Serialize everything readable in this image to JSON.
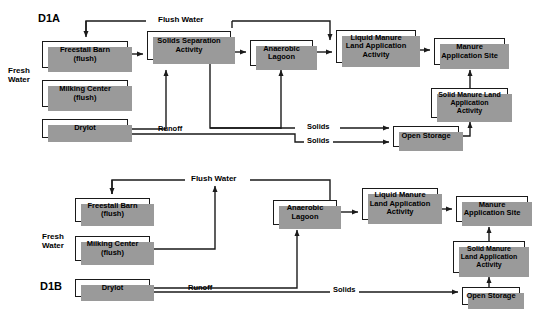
{
  "figure": {
    "background_color": "#ffffff",
    "line_color": "#1a1a1a",
    "shadow_color": "#9a9a9a",
    "box_fill": "#ffffff"
  },
  "diagrams": [
    {
      "id_label": "D1A",
      "id_pos": {
        "x": 38,
        "y": 12,
        "size": 11
      },
      "side_label": {
        "text": "Fresh\nWater",
        "x": 8,
        "y": 66,
        "size": 8
      },
      "nodes": [
        {
          "name": "freestall-barn",
          "label": "Freestall Barn\n(flush)",
          "x": 42,
          "y": 41,
          "w": 86,
          "h": 27,
          "size": 7.5
        },
        {
          "name": "milking-center",
          "label": "Milking Center\n(flush)",
          "x": 42,
          "y": 80,
          "w": 86,
          "h": 27,
          "size": 7.5
        },
        {
          "name": "drylot",
          "label": "Drylot",
          "x": 42,
          "y": 119,
          "w": 86,
          "h": 19,
          "size": 7.5
        },
        {
          "name": "solids-separation-activity",
          "label": "Solids Separation\nActivity",
          "x": 147,
          "y": 31,
          "w": 84,
          "h": 29,
          "size": 7.5
        },
        {
          "name": "anaerobic-lagoon",
          "label": "Anaerobic\nLagoon",
          "x": 250,
          "y": 40,
          "w": 63,
          "h": 26,
          "size": 7.5
        },
        {
          "name": "liquid-manure-land-application-activity",
          "label": "Liquid Manure\nLand Application\nActivity",
          "x": 336,
          "y": 30,
          "w": 80,
          "h": 33,
          "size": 7.5
        },
        {
          "name": "manure-application-site",
          "label": "Manure\nApplication Site",
          "x": 434,
          "y": 38,
          "w": 71,
          "h": 27,
          "size": 7.5
        },
        {
          "name": "solid-manure-land-application-activity",
          "label": "Solid Manure Land\nApplication\nActivity",
          "x": 431,
          "y": 88,
          "w": 77,
          "h": 30,
          "size": 7
        },
        {
          "name": "open-storage",
          "label": "Open Storage",
          "x": 393,
          "y": 126,
          "w": 66,
          "h": 21,
          "size": 7.5
        }
      ],
      "edge_labels": [
        {
          "name": "flush-water-label",
          "text": "Flush Water",
          "x": 155,
          "y": 12,
          "size": 8
        },
        {
          "name": "runoff-label",
          "text": "Runoff",
          "x": 155,
          "y": 126,
          "size": 7.5
        },
        {
          "name": "solids-label-upper",
          "text": "Solids",
          "x": 304,
          "y": 123,
          "size": 7.5
        },
        {
          "name": "solids-label-lower",
          "text": "Solids",
          "x": 304,
          "y": 137,
          "size": 7.5
        }
      ]
    },
    {
      "id_label": "D1B",
      "id_pos": {
        "x": 40,
        "y": 280,
        "size": 11
      },
      "side_label": {
        "text": "Fresh\nWater",
        "x": 42,
        "y": 232,
        "size": 8
      },
      "nodes": [
        {
          "name": "freestall-barn",
          "label": "Freestall Barn\n(flush)",
          "x": 75,
          "y": 198,
          "w": 75,
          "h": 24,
          "size": 7.5
        },
        {
          "name": "milking-center",
          "label": "Milking Center\n(flush)",
          "x": 75,
          "y": 236,
          "w": 75,
          "h": 25,
          "size": 7.5
        },
        {
          "name": "drylot",
          "label": "Drylot",
          "x": 75,
          "y": 279,
          "w": 75,
          "h": 18,
          "size": 7.5
        },
        {
          "name": "anaerobic-lagoon",
          "label": "Anaerobic\nLagoon",
          "x": 273,
          "y": 200,
          "w": 64,
          "h": 25,
          "size": 7.5
        },
        {
          "name": "liquid-manure-land-application-activity",
          "label": "Liquid Manure\nLand Application\nActivity",
          "x": 362,
          "y": 188,
          "w": 76,
          "h": 32,
          "size": 7.5
        },
        {
          "name": "manure-application-site",
          "label": "Manure\nApplication Site",
          "x": 456,
          "y": 196,
          "w": 72,
          "h": 26,
          "size": 7.5
        },
        {
          "name": "solid-manure-land-application-activity",
          "label": "Solid Manure\nLand Application\nActivity",
          "x": 453,
          "y": 241,
          "w": 72,
          "h": 32,
          "size": 7
        },
        {
          "name": "open-storage",
          "label": "Open Storage",
          "x": 462,
          "y": 287,
          "w": 58,
          "h": 18,
          "size": 7.5
        }
      ],
      "edge_labels": [
        {
          "name": "flush-water-label",
          "text": "Flush Water",
          "x": 188,
          "y": 175,
          "size": 8
        },
        {
          "name": "runoff-label",
          "text": "Runoff",
          "x": 185,
          "y": 285,
          "size": 7.5
        },
        {
          "name": "solids-label",
          "text": "Solids",
          "x": 330,
          "y": 285,
          "size": 7.5
        }
      ]
    }
  ],
  "connectors": {
    "d1a": [
      "flush-water-bus from solids-separation top to freestall-barn top (arrow down)",
      "flush-water-bus right branch down to anaerobic-lagoon top",
      "freestall-barn right to solids-separation left (arrow)",
      "solids-separation right to anaerobic-lagoon left (arrow)",
      "anaerobic-lagoon right to liquid-manure left (arrow)",
      "liquid-manure right to manure-application-site left (arrow)",
      "solid-manure right-up to manure-application-site bottom (arrow up)",
      "open-storage right up to solid-manure bottom (arrow up)",
      "solids-separation bottom down to solids line into open-storage (arrow right)",
      "drylot right runoff line to anaerobic-lagoon bottom (arrow up)",
      "drylot runoff second line to open-storage left (arrow right)"
    ],
    "d1b": [
      "flush-water-bus from anaerobic-lagoon area to freestall-barn top (arrow down)",
      "milking-center right to flush-water riser (arrow up)",
      "freestall-barn/milking line to anaerobic-lagoon bottom (arrow up)",
      "anaerobic-lagoon right to liquid-manure left (arrow)",
      "liquid-manure right to manure-application-site left (arrow)",
      "solid-manure top to manure-application-site bottom (arrow up)",
      "open-storage top to solid-manure bottom (arrow up)",
      "drylot right runoff solids line to open-storage left (arrow right)"
    ]
  }
}
